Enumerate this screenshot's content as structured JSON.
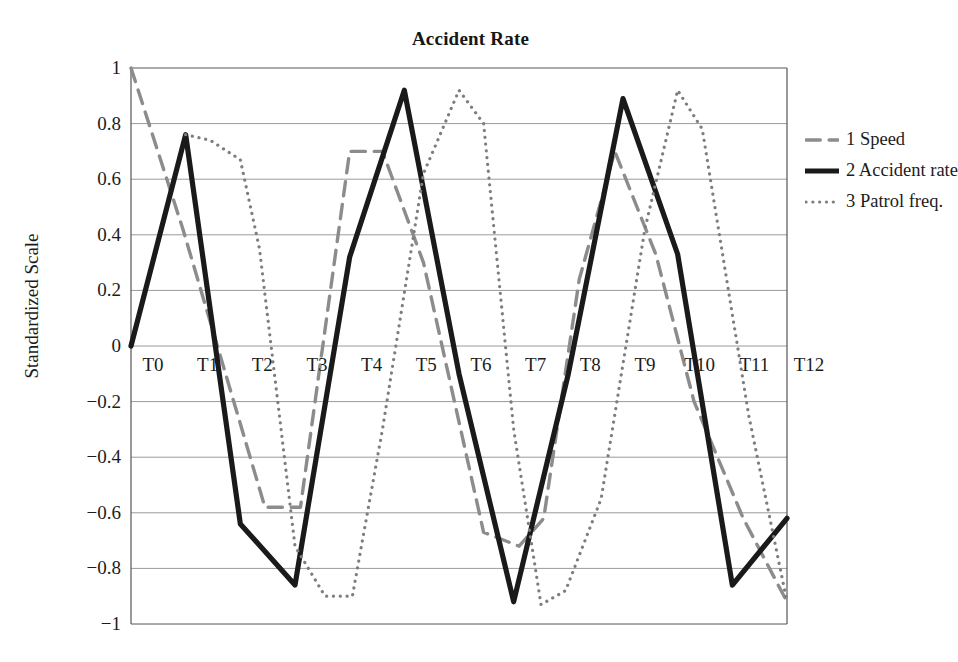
{
  "chart_data": {
    "type": "line",
    "title": "Accident Rate",
    "xlabel": "",
    "ylabel": "Standardized Scale",
    "categories": [
      "T0",
      "T1",
      "T2",
      "T3",
      "T4",
      "T5",
      "T6",
      "T7",
      "T8",
      "T9",
      "T10",
      "T11",
      "T12"
    ],
    "ylim": [
      -1,
      1
    ],
    "yticks": [
      "1",
      "0.8",
      "0.6",
      "0.4",
      "0.2",
      "0",
      "−0.2",
      "−0.4",
      "−0.6",
      "−0.8",
      "−1"
    ],
    "ytick_values": [
      1,
      0.8,
      0.6,
      0.4,
      0.2,
      0,
      -0.2,
      -0.4,
      -0.6,
      -0.8,
      -1
    ],
    "grid": "horizontal",
    "legend_position": "right-top",
    "series": [
      {
        "name": "1 Speed",
        "style": "dashed",
        "color": "#8c8c8c",
        "width": 3.4,
        "x": [
          0,
          0.95,
          2.45,
          3.1,
          4.0,
          4.6,
          5.35,
          6.45,
          7.1,
          7.55,
          8.2,
          8.85,
          9.6,
          10.3,
          11.2,
          12.0
        ],
        "values": [
          1.0,
          0.42,
          -0.58,
          -0.58,
          0.7,
          0.7,
          0.3,
          -0.67,
          -0.72,
          -0.62,
          0.24,
          0.7,
          0.33,
          -0.2,
          -0.62,
          -0.92
        ]
      },
      {
        "name": "2 Accident rate",
        "style": "solid",
        "color": "#1a1a1a",
        "width": 5.2,
        "x": [
          0,
          1,
          2,
          3,
          4,
          5,
          6,
          7,
          8,
          9,
          10,
          11,
          12
        ],
        "values": [
          0.0,
          0.76,
          -0.64,
          -0.86,
          0.32,
          0.92,
          -0.1,
          -0.92,
          -0.1,
          0.89,
          0.33,
          -0.86,
          -0.62
        ]
      },
      {
        "name": "3 Patrol freq.",
        "style": "dotted",
        "color": "#7e7e7e",
        "width": 3.2,
        "x": [
          1.0,
          1.45,
          2.0,
          2.35,
          3.0,
          3.55,
          4.05,
          4.6,
          5.35,
          6.0,
          6.45,
          7.0,
          7.5,
          7.95,
          8.6,
          9.4,
          10.0,
          10.45,
          11.3,
          12.0
        ],
        "values": [
          0.76,
          0.74,
          0.67,
          0.35,
          -0.72,
          -0.9,
          -0.9,
          -0.3,
          0.62,
          0.92,
          0.8,
          -0.3,
          -0.93,
          -0.88,
          -0.55,
          0.42,
          0.92,
          0.78,
          -0.25,
          -0.92
        ]
      }
    ]
  },
  "legend": {
    "items": [
      {
        "label": "1 Speed",
        "style": "dashed"
      },
      {
        "label": "2 Accident rate",
        "style": "solid"
      },
      {
        "label": "3 Patrol freq.",
        "style": "dotted"
      }
    ]
  }
}
